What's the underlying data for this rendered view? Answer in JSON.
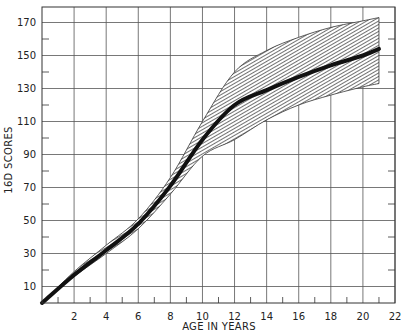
{
  "chart_data": {
    "type": "line",
    "title": "",
    "xlabel": "AGE IN YEARS",
    "ylabel": "16D SCORES",
    "xlim": [
      0,
      22
    ],
    "ylim": [
      0,
      180
    ],
    "x_ticks": [
      2,
      4,
      6,
      8,
      10,
      12,
      14,
      16,
      18,
      20,
      22
    ],
    "y_ticks": [
      10,
      30,
      50,
      70,
      90,
      110,
      130,
      150,
      170
    ],
    "grid": true,
    "legend": null,
    "x": [
      0,
      2,
      4,
      6,
      8,
      10,
      12,
      14,
      16,
      18,
      20,
      21
    ],
    "series": [
      {
        "name": "mean",
        "style": "thick black line",
        "values": [
          0,
          17,
          32,
          48,
          71,
          99,
          120,
          129,
          137,
          144,
          150,
          154
        ]
      },
      {
        "name": "upper band",
        "style": "hatched band edge",
        "values": [
          0,
          19,
          35,
          51,
          76,
          110,
          140,
          153,
          161,
          167,
          171,
          173
        ]
      },
      {
        "name": "lower band",
        "style": "hatched band edge",
        "values": [
          0,
          16,
          30,
          45,
          66,
          89,
          99,
          111,
          120,
          126,
          131,
          133
        ]
      }
    ]
  },
  "colors": {
    "line": "#111111",
    "grid": "#555555",
    "band_fill": "#9a9a9a"
  }
}
